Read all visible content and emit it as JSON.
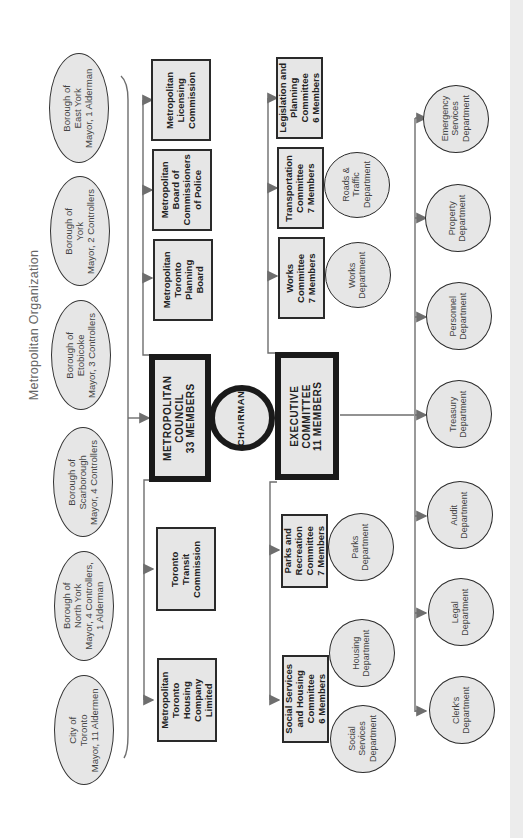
{
  "title": "Metropolitan Organization",
  "boroughs": [
    {
      "label": "Borough of\nEast York\nMayor, 1 Alderman"
    },
    {
      "label": "Borough of\nYork\nMayor, 2 Controllers"
    },
    {
      "label": "Borough of\nEtobicoke\nMayor, 3 Controllers"
    },
    {
      "label": "Borough of\nScarborough\nMayor, 4 Controllers"
    },
    {
      "label": "Borough of\nNorth York\nMayor, 4 Controllers,\n1 Alderman"
    },
    {
      "label": "City of\nToronto\nMayor, 11 Aldermen"
    }
  ],
  "council": {
    "label": "METROPOLITAN\nCOUNCIL\n33 MEMBERS"
  },
  "chairman": {
    "label": "CHAIRMAN"
  },
  "executive": {
    "label": "EXECUTIVE\nCOMMITTEE\n11 MEMBERS"
  },
  "agencies": [
    {
      "label": "Metropolitan\nLicensing\nCommission"
    },
    {
      "label": "Metropolitan\nBoard of\nCommissioners\nof Police"
    },
    {
      "label": "Metropolitan\nToronto\nPlanning\nBoard"
    },
    {
      "label": "Toronto\nTransit\nCommission"
    },
    {
      "label": "Metropolitan\nToronto\nHousing\nCompany\nLimited"
    }
  ],
  "committees": [
    {
      "label": "Legislation and\nPlanning\nCommittee\n6 Members"
    },
    {
      "label": "Transportation\nCommittee\n7 Members"
    },
    {
      "label": "Works\nCommittee\n7 Members"
    },
    {
      "label": "Parks and\nRecreation\nCommittee\n7 Members"
    },
    {
      "label": "Social Services\nand Housing\nCommittee\n6 Members"
    }
  ],
  "committee_departments": [
    {
      "label": "Roads &\nTraffic\nDepartment"
    },
    {
      "label": "Works\nDepartment"
    },
    {
      "label": "Parks\nDepartment"
    },
    {
      "label": "Housing\nDepartment"
    },
    {
      "label": "Social\nServices\nDepartment"
    }
  ],
  "departments": [
    {
      "label": "Emergency\nServices\nDepartment"
    },
    {
      "label": "Property\nDepartment"
    },
    {
      "label": "Personnel\nDepartment"
    },
    {
      "label": "Treasury\nDepartment"
    },
    {
      "label": "Audit\nDepartment"
    },
    {
      "label": "Legal\nDepartment"
    },
    {
      "label": "Clerk's\nDepartment"
    }
  ],
  "colors": {
    "fill": "#e6e6e6",
    "line": "#6e6e6e",
    "border": "#1a1a1a",
    "title": "#666666"
  }
}
